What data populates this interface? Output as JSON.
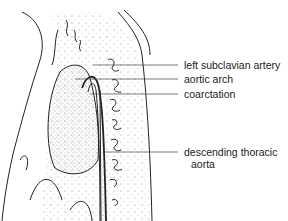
{
  "diagram": {
    "labels": [
      {
        "id": "left-subclavian-artery",
        "text": "left subclavian artery",
        "y": 65,
        "line_x1": 93
      },
      {
        "id": "aortic-arch",
        "text": "aortic arch",
        "y": 79,
        "line_x1": 75
      },
      {
        "id": "coarctation",
        "text": "coarctation",
        "y": 94,
        "line_x1": 90
      },
      {
        "id": "descending-thoracic-aorta",
        "text": "descending thoracic",
        "text2": "aorta",
        "y": 152,
        "line_x1": 105
      }
    ],
    "colors": {
      "ink": "#222222",
      "background": "#ffffff",
      "stipple": "#555555"
    }
  }
}
